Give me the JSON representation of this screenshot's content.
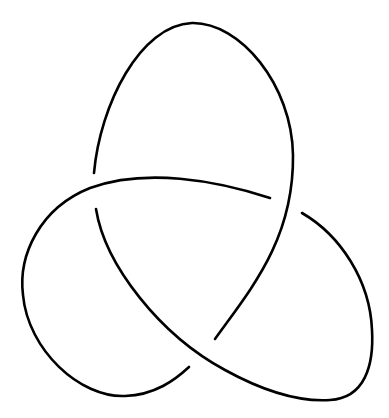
{
  "diagram": {
    "type": "trefoil-knot",
    "background": "#ffffff",
    "stroke_color": "#000000",
    "stroke_width": 2.6,
    "crossings": 3,
    "strands": [
      {
        "id": "top-lobe",
        "d": "M 94 173 C 100 105, 140 25, 192 23 C 240 22, 292 85, 293 155 C 294 240, 250 290, 215 339"
      },
      {
        "id": "left-lobe",
        "d": "M 270 198 C 215 180, 145 168, 90 188 C 40 208, 18 255, 23 295 C 28 350, 80 398, 125 396 C 155 395, 175 380, 189 367"
      },
      {
        "id": "right-lobe",
        "d": "M 96 209 C 105 265, 160 335, 225 370 C 265 392, 300 402, 330 400 C 365 398, 374 365, 372 330 C 370 280, 340 235, 302 213"
      }
    ]
  }
}
